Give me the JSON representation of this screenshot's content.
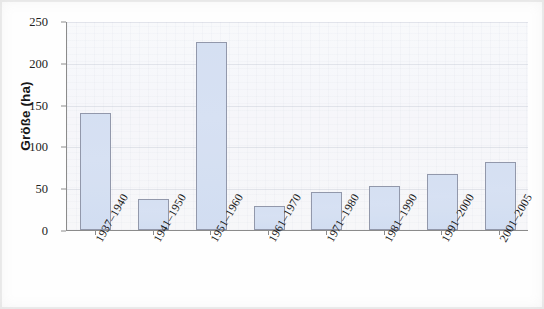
{
  "chart_data": {
    "type": "bar",
    "title": "",
    "subtitle": "",
    "xlabel": "",
    "ylabel": "Größe (ha)",
    "categories": [
      "1937–1940",
      "1941–1950",
      "1951–1960",
      "1961–1970",
      "1971–1980",
      "1981–1990",
      "1991–2000",
      "2001–2005"
    ],
    "values": [
      140,
      37,
      225,
      29,
      46,
      53,
      67,
      81
    ],
    "ylim": [
      0,
      250
    ],
    "yticks": [
      0,
      50,
      100,
      150,
      200,
      250
    ],
    "ytick_labels": [
      "0",
      "50",
      "100",
      "150",
      "200",
      "250"
    ],
    "grid": true,
    "grid_axis": "y",
    "legend": null,
    "legend_position": "none",
    "series": [
      {
        "name": "Größe (ha)",
        "values": [
          140,
          37,
          225,
          29,
          46,
          53,
          67,
          81
        ]
      }
    ],
    "annotations": [],
    "colors": {
      "bar_fill": "#ccd9f0",
      "bar_border": "#7b8299",
      "plot_background": "#f5f6fa",
      "gridline": "#969eb4",
      "axis_line": "#8b8b8b",
      "text": "#171717"
    }
  }
}
